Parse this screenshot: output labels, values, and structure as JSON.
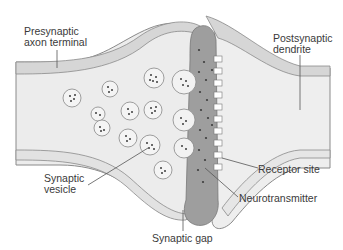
{
  "diagram": {
    "colors": {
      "background": "#ffffff",
      "cell_fill": "#ececec",
      "membrane_band": "#d6d6d6",
      "membrane_line": "#8a8a8a",
      "cleft_fill": "#9e9e9e",
      "vesicle_fill": "#f4f4f4",
      "dot": "#3d3d3d",
      "label_text": "#3a3a3a",
      "leader_line": "#555555"
    },
    "labels": [
      {
        "id": "presynaptic",
        "text": "Presynaptic\naxon terminal",
        "x": 24,
        "y": 26
      },
      {
        "id": "postsynaptic",
        "text": "Postsynaptic\ndendrite",
        "x": 273,
        "y": 33
      },
      {
        "id": "vesicle",
        "text": "Synaptic\nvesicle",
        "x": 44,
        "y": 173
      },
      {
        "id": "receptor",
        "text": "Receptor site",
        "x": 258,
        "y": 164
      },
      {
        "id": "neurotransmitter",
        "text": "Neurotransmitter",
        "x": 239,
        "y": 193
      },
      {
        "id": "gap",
        "text": "Synaptic gap",
        "x": 152,
        "y": 233
      }
    ]
  }
}
